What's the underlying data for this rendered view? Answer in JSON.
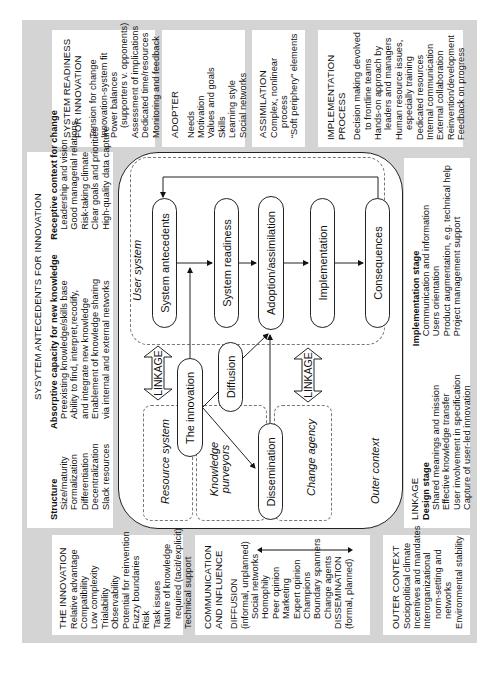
{
  "figure": {
    "orientation": "rotated -90deg (text reads bottom-to-top)",
    "background_color": "#d4d4d4"
  },
  "top_boxes": {
    "system_readiness": {
      "title": [
        "SYSTEM READINESS",
        "FOR INNOVATION"
      ],
      "items": [
        "Tension for change",
        "Innovation-system fit",
        "Power balances",
        "(supporters v. opponents)",
        "Assessment of implications",
        "Dedicated time/resources",
        "Monitoring and feedback"
      ]
    },
    "adopter": {
      "title": [
        "ADOPTER"
      ],
      "items": [
        "Needs",
        "Motivation",
        "Values and goals",
        "Skills",
        "Learning style",
        "Social networks"
      ]
    },
    "assimilation": {
      "title": [
        "ASSIMILATION"
      ],
      "items": [
        "Complex, nonlinear",
        "process",
        "“Soft periphery” elements"
      ]
    },
    "implementation_process": {
      "title": [
        "IMPLEMENTATION",
        "PROCESS"
      ],
      "items": [
        "Decision making devolved",
        "to frontline teams",
        "Hands-on approach by",
        "leaders and managers",
        "Human resource issues,",
        "especially training",
        "Dedicated resources",
        "Internal communication",
        "External collaboration",
        "Reinvention/development",
        "Feedback on progress"
      ]
    }
  },
  "system_antecedents": {
    "title": "SYSYTEM ANTECEDENTS FOR INNOVATION",
    "columns": [
      {
        "heading": "Structure",
        "items": [
          "Size/maturity",
          "Formalization",
          "Differentiation",
          "Decentralization",
          "Slack resources"
        ]
      },
      {
        "heading": "Absorptive capacity for new knowledge",
        "items": [
          "Preexisting knowledge/skills base",
          "Ability to find, interpret,recodify,",
          "and integrate new knowledge",
          "Enablement of knowledge sharing",
          "via internal and external networks"
        ]
      },
      {
        "heading": "Receptive context for change",
        "items": [
          "Leadership and vision",
          "Good managerial relations",
          "Risk-taking climate",
          "Clear goals and priorities",
          "High-quality data capture"
        ]
      }
    ]
  },
  "linkage_box": {
    "title": "LINKAGE",
    "columns": [
      {
        "heading": "Design stage",
        "items": [
          "Shared meanings and mission",
          "Effective knowledge transfer",
          "User involvement in specification",
          "Capture of user-led innovation"
        ]
      },
      {
        "heading": "Implementation stage",
        "items": [
          "Communication and information",
          "Users orientation",
          "Product augmentation, e.g. technical help",
          "Project management support"
        ]
      }
    ]
  },
  "bottom_boxes": {
    "the_innovation": {
      "title": [
        "THE INNOVATION"
      ],
      "items": [
        "Relative advantage",
        "Compatibility",
        "Low complexity",
        "Trialability",
        "Observability",
        "Potential for reinvention",
        "Fuzzy boundaries",
        "Risk",
        "Task issues",
        "Nature of knowledge",
        "required (tacit/explicit)",
        "Technical support"
      ]
    },
    "communication": {
      "title": [
        "COMMUNICATION",
        "AND INFLUENCE"
      ],
      "diffusion": [
        "DIFFUSION",
        "(informal, unplanned)"
      ],
      "items": [
        "Social networks",
        "Homophily",
        "Peer opinion",
        "Marketing",
        "Expert opinion",
        "Champions",
        "Boundary spanners",
        "Change agents"
      ],
      "dissemination": [
        "DISSEMINATION",
        "(formal, planned)"
      ]
    },
    "outer_context": {
      "title": [
        "OUTER CONTEXT"
      ],
      "items": [
        "Sociopolitical climate",
        "Incentives and mandates",
        "Interorganizational",
        "norm-setting and",
        "networks",
        "Environmental stability"
      ]
    }
  },
  "central": {
    "regions": {
      "user_system": "User system",
      "resource_system": "Resource system",
      "knowledge_purveyors": [
        "Knowledge",
        "purveyors"
      ],
      "change_agency": "Change agency",
      "outer_context": "Outer context"
    },
    "pills": {
      "system_antecedents": "System antecedents",
      "system_readiness": "System readiness",
      "adoption": "Adoption/assimilation",
      "implementation": "Implementation",
      "consequences": "Consequences",
      "innovation": "The innovation",
      "diffusion": "Diffusion",
      "dissemination": "Dissemination"
    },
    "linkage_label": "LINKAGE"
  }
}
